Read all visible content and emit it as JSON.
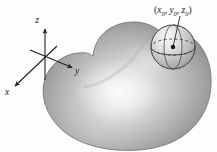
{
  "figure": {
    "background_color": "#fdfdfd",
    "width": 217,
    "height": 152
  },
  "axes": {
    "origin": {
      "x": 45,
      "y": 57
    },
    "stroke_color": "#222222",
    "items": [
      {
        "name": "z-axis",
        "label": "z",
        "label_x": 37,
        "label_y": 23,
        "tip_x": 45,
        "tip_y": 28,
        "tail_x": 45,
        "tail_y": 80
      },
      {
        "name": "y-axis",
        "label": "y",
        "label_x": 77,
        "label_y": 74,
        "tip_x": 73,
        "tip_y": 68,
        "tail_x": 30,
        "tail_y": 50
      },
      {
        "name": "x-axis",
        "label": "x",
        "label_x": 7,
        "label_y": 95,
        "tip_x": 14,
        "tip_y": 87,
        "tail_x": 57,
        "tail_y": 46
      }
    ]
  },
  "solid": {
    "name": "blob-solid",
    "fill_light": "#f2f2f2",
    "fill_mid": "#b9b9b9",
    "fill_dark": "#7e7e7e",
    "outline_color": "#6a6a6a",
    "highlight_center": {
      "x": 118,
      "y": 88
    }
  },
  "sphere": {
    "name": "tangent-sphere",
    "center": {
      "x": 173,
      "y": 47
    },
    "radius": 22,
    "fill_light": "#ececec",
    "fill_dark": "#9b9b9b",
    "outline_color": "#4a4a4a",
    "dash_color": "#3b3b3b",
    "center_dot_color": "#1a1a1a",
    "center_dot_radius": 2.2
  },
  "point_label": {
    "name": "point-coordinates-label",
    "open_paren": "(",
    "x_var": "x",
    "x_sub": "0",
    "comma1": ", ",
    "y_var": "y",
    "y_sub": "0",
    "comma2": ", ",
    "z_var": "z",
    "z_sub": "0",
    "close_paren": ")",
    "text_x": 154,
    "text_y": 13,
    "leader": {
      "from_x": 180,
      "from_y": 16,
      "to_x": 173,
      "to_y": 47
    }
  }
}
